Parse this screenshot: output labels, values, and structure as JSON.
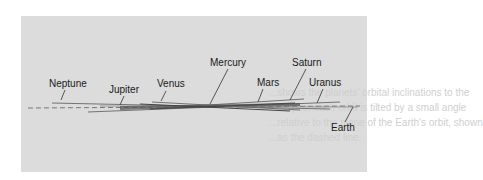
{
  "figure": {
    "reference_plane": "Earth",
    "labels": [
      {
        "name": "Neptune",
        "x": 49,
        "y": 78
      },
      {
        "name": "Jupiter",
        "x": 109,
        "y": 84
      },
      {
        "name": "Venus",
        "x": 157,
        "y": 78
      },
      {
        "name": "Mercury",
        "x": 210,
        "y": 57
      },
      {
        "name": "Mars",
        "x": 257,
        "y": 77
      },
      {
        "name": "Saturn",
        "x": 292,
        "y": 57
      },
      {
        "name": "Uranus",
        "x": 309,
        "y": 77
      },
      {
        "name": "Earth",
        "x": 331,
        "y": 122
      }
    ]
  },
  "bleed_through": [
    "...shows the planets' orbital inclinations to the",
    "...ecliptic; each orbit is tilted by a small angle",
    "...relative to the plane of the Earth's orbit, shown",
    "...as the dashed line."
  ],
  "colors": {
    "panel": "#dcdcdc",
    "lines": "#555555",
    "dark_band": "#4a4a4a",
    "text": "#1a1a1a"
  }
}
